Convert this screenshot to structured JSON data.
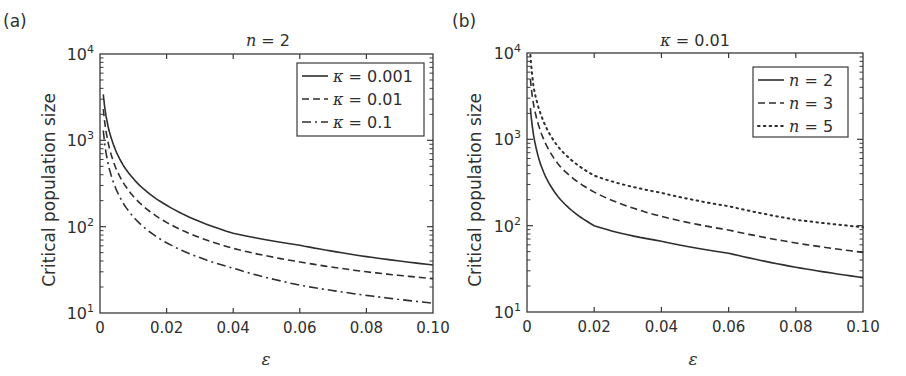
{
  "chart_data": [
    {
      "type": "line",
      "panel_label": "(a)",
      "title": "n = 2",
      "xlabel": "ε",
      "ylabel": "Critical population size",
      "xscale": "linear",
      "yscale": "log",
      "xlim": [
        0,
        0.1
      ],
      "ylim": [
        10,
        10000
      ],
      "xticks": [
        "0",
        "0.02",
        "0.04",
        "0.06",
        "0.08",
        "0.10"
      ],
      "yticks": [
        "10^1",
        "10^2",
        "10^3",
        "10^4"
      ],
      "grid": false,
      "legend_position": "upper right",
      "x": [
        0.001,
        0.002,
        0.004,
        0.01,
        0.02,
        0.04,
        0.06,
        0.08,
        0.1
      ],
      "series": [
        {
          "name": "κ = 0.001",
          "style": "solid",
          "values": [
            3400,
            1750,
            900,
            360,
            177,
            84,
            61,
            45,
            36
          ]
        },
        {
          "name": "κ = 0.01",
          "style": "dashed",
          "values": [
            2300,
            1150,
            570,
            225,
            112,
            56,
            39,
            30,
            25
          ]
        },
        {
          "name": "κ = 0.1",
          "style": "dashdot",
          "values": [
            1300,
            650,
            330,
            130,
            65,
            33,
            21,
            16,
            13
          ]
        }
      ]
    },
    {
      "type": "line",
      "panel_label": "(b)",
      "title": "κ = 0.01",
      "xlabel": "ε",
      "ylabel": "Critical population size",
      "xscale": "linear",
      "yscale": "log",
      "xlim": [
        0,
        0.1
      ],
      "ylim": [
        10,
        10000
      ],
      "xticks": [
        "0",
        "0.02",
        "0.04",
        "0.06",
        "0.08",
        "0.10"
      ],
      "yticks": [
        "10^1",
        "10^2",
        "10^3",
        "10^4"
      ],
      "grid": false,
      "legend_position": "upper right",
      "x": [
        0.001,
        0.002,
        0.004,
        0.01,
        0.02,
        0.04,
        0.06,
        0.08,
        0.1
      ],
      "series": [
        {
          "name": "n = 2",
          "style": "solid",
          "values": [
            2300,
            1100,
            520,
            200,
            100,
            66,
            48,
            33,
            25
          ]
        },
        {
          "name": "n = 3",
          "style": "dashed",
          "values": [
            5000,
            2500,
            1250,
            480,
            245,
            128,
            89,
            63,
            49
          ]
        },
        {
          "name": "n = 5",
          "style": "dotted",
          "values": [
            9500,
            4000,
            2000,
            760,
            380,
            240,
            168,
            117,
            96
          ]
        }
      ]
    }
  ],
  "panels": [
    {
      "label": "(a)",
      "title_var": "n",
      "title_val": " = 2",
      "legend": [
        {
          "var": "κ",
          "val": " = 0.001"
        },
        {
          "var": "κ",
          "val": " = 0.01"
        },
        {
          "var": "κ",
          "val": " = 0.1"
        }
      ]
    },
    {
      "label": "(b)",
      "title_var": "κ",
      "title_val": " = 0.01",
      "legend": [
        {
          "var": "n",
          "val": " = 2"
        },
        {
          "var": "n",
          "val": " = 3"
        },
        {
          "var": "n",
          "val": " = 5"
        }
      ]
    }
  ],
  "colors": {
    "line": "#2e2e2e",
    "axis": "#3a3a3a",
    "text": "#2f2f2f",
    "background": "#ffffff"
  }
}
